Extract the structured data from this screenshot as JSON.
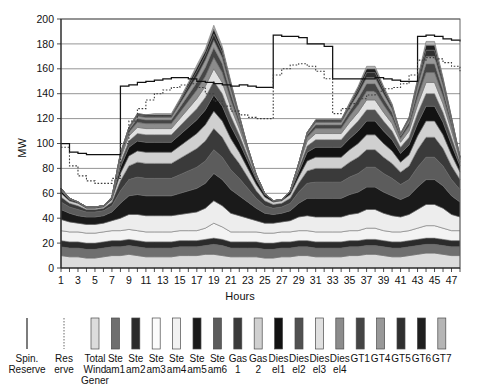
{
  "chart_data": {
    "type": "area",
    "title": "",
    "xlabel": "Hours",
    "ylabel": "MW",
    "ylim": [
      0,
      200
    ],
    "ytick_step": 20,
    "yticks": [
      0,
      20,
      40,
      60,
      80,
      100,
      120,
      140,
      160,
      180,
      200
    ],
    "xlim": [
      1,
      48
    ],
    "xticks": [
      1,
      3,
      5,
      7,
      9,
      11,
      13,
      15,
      17,
      19,
      21,
      23,
      25,
      27,
      29,
      31,
      33,
      35,
      37,
      39,
      41,
      43,
      45,
      47
    ],
    "grid": true,
    "legend_position": "bottom",
    "x": [
      1,
      2,
      3,
      4,
      5,
      6,
      7,
      8,
      9,
      10,
      11,
      12,
      13,
      14,
      15,
      16,
      17,
      18,
      19,
      20,
      21,
      22,
      23,
      24,
      25,
      26,
      27,
      28,
      29,
      30,
      31,
      32,
      33,
      34,
      35,
      36,
      37,
      38,
      39,
      40,
      41,
      42,
      43,
      44,
      45,
      46,
      47,
      48
    ],
    "series": [
      {
        "name": "Total Wind Gener",
        "color": "#dcdcdc",
        "values": [
          10,
          9,
          9,
          8,
          8,
          9,
          10,
          10,
          11,
          10,
          9,
          9,
          9,
          9,
          10,
          10,
          10,
          11,
          11,
          10,
          9,
          9,
          9,
          9,
          8,
          8,
          9,
          9,
          10,
          10,
          9,
          9,
          9,
          9,
          10,
          10,
          11,
          11,
          10,
          9,
          9,
          10,
          11,
          12,
          12,
          11,
          10,
          10
        ]
      },
      {
        "name": "Ste am1",
        "color": "#6f6f6f",
        "values": [
          7,
          7,
          7,
          7,
          7,
          7,
          7,
          7,
          7,
          7,
          7,
          7,
          7,
          7,
          7,
          7,
          7,
          7,
          8,
          8,
          7,
          7,
          7,
          7,
          7,
          7,
          7,
          7,
          7,
          7,
          7,
          7,
          7,
          7,
          7,
          7,
          7,
          7,
          7,
          7,
          7,
          7,
          7,
          7,
          7,
          7,
          7,
          7
        ]
      },
      {
        "name": "Ste am2",
        "color": "#2b2b2b",
        "values": [
          5,
          5,
          5,
          5,
          5,
          5,
          5,
          5,
          5,
          5,
          5,
          5,
          5,
          5,
          5,
          5,
          5,
          5,
          5,
          5,
          5,
          5,
          5,
          5,
          5,
          5,
          5,
          5,
          5,
          5,
          5,
          5,
          5,
          5,
          5,
          5,
          5,
          5,
          5,
          5,
          5,
          5,
          5,
          5,
          5,
          5,
          5,
          5
        ]
      },
      {
        "name": "Ste am3",
        "color": "#f3f3f3",
        "values": [
          8,
          8,
          8,
          8,
          8,
          8,
          8,
          8,
          8,
          8,
          8,
          8,
          8,
          8,
          8,
          8,
          8,
          9,
          12,
          10,
          8,
          8,
          8,
          8,
          8,
          8,
          8,
          8,
          8,
          8,
          8,
          8,
          8,
          8,
          8,
          8,
          9,
          9,
          8,
          8,
          8,
          8,
          9,
          10,
          10,
          9,
          8,
          8
        ]
      },
      {
        "name": "Ste am4",
        "color": "#ededed",
        "values": [
          9,
          8,
          7,
          7,
          7,
          7,
          8,
          10,
          12,
          13,
          13,
          13,
          13,
          13,
          13,
          14,
          15,
          16,
          18,
          17,
          15,
          13,
          11,
          9,
          8,
          8,
          8,
          9,
          11,
          12,
          12,
          12,
          12,
          12,
          13,
          14,
          15,
          15,
          14,
          13,
          12,
          13,
          15,
          17,
          17,
          16,
          13,
          11
        ]
      },
      {
        "name": "Ste am5",
        "color": "#1a1a1a",
        "values": [
          8,
          7,
          6,
          6,
          6,
          6,
          7,
          12,
          15,
          16,
          16,
          16,
          16,
          16,
          17,
          18,
          19,
          20,
          22,
          21,
          19,
          16,
          13,
          10,
          8,
          7,
          7,
          8,
          11,
          14,
          15,
          15,
          15,
          15,
          16,
          17,
          18,
          18,
          17,
          16,
          14,
          15,
          18,
          20,
          20,
          18,
          15,
          12
        ]
      },
      {
        "name": "Ste am6",
        "color": "#5c5c5c",
        "values": [
          6,
          5,
          5,
          4,
          4,
          4,
          5,
          10,
          13,
          14,
          14,
          14,
          14,
          14,
          15,
          16,
          17,
          18,
          19,
          18,
          16,
          14,
          11,
          8,
          6,
          5,
          5,
          6,
          9,
          12,
          13,
          13,
          13,
          13,
          14,
          15,
          16,
          16,
          15,
          14,
          12,
          13,
          16,
          18,
          18,
          16,
          13,
          10
        ]
      },
      {
        "name": "Gas 1",
        "color": "#3a3a3a",
        "values": [
          4,
          3,
          3,
          2,
          2,
          2,
          3,
          8,
          11,
          12,
          12,
          12,
          12,
          12,
          13,
          14,
          15,
          16,
          17,
          16,
          14,
          12,
          9,
          6,
          4,
          3,
          3,
          4,
          7,
          10,
          11,
          11,
          11,
          11,
          12,
          13,
          14,
          14,
          13,
          12,
          10,
          11,
          14,
          16,
          16,
          14,
          11,
          8
        ]
      },
      {
        "name": "Gas 2",
        "color": "#d0d0d0",
        "values": [
          3,
          2,
          2,
          1,
          1,
          1,
          2,
          6,
          8,
          9,
          9,
          9,
          9,
          9,
          10,
          11,
          12,
          13,
          14,
          13,
          11,
          9,
          7,
          5,
          3,
          2,
          2,
          3,
          5,
          8,
          9,
          9,
          9,
          9,
          10,
          11,
          12,
          12,
          11,
          10,
          8,
          9,
          11,
          13,
          13,
          11,
          9,
          6
        ]
      },
      {
        "name": "Dies el1",
        "color": "#121212",
        "values": [
          2,
          1,
          1,
          1,
          1,
          1,
          1,
          5,
          7,
          8,
          8,
          8,
          8,
          8,
          9,
          10,
          11,
          12,
          13,
          12,
          10,
          8,
          6,
          4,
          2,
          1,
          1,
          2,
          4,
          7,
          8,
          8,
          8,
          8,
          9,
          10,
          11,
          11,
          10,
          9,
          7,
          8,
          10,
          12,
          12,
          10,
          8,
          5
        ]
      },
      {
        "name": "Dies el2",
        "color": "#515151",
        "values": [
          1,
          1,
          0,
          0,
          0,
          0,
          1,
          4,
          5,
          6,
          6,
          6,
          6,
          6,
          7,
          8,
          9,
          10,
          11,
          10,
          8,
          6,
          4,
          2,
          1,
          0,
          0,
          1,
          3,
          5,
          6,
          6,
          6,
          6,
          7,
          8,
          9,
          9,
          8,
          7,
          5,
          6,
          8,
          10,
          10,
          8,
          6,
          3
        ]
      },
      {
        "name": "Dies el3",
        "color": "#e0e0e0",
        "values": [
          1,
          0,
          0,
          0,
          0,
          0,
          0,
          3,
          4,
          5,
          5,
          5,
          5,
          5,
          6,
          7,
          8,
          9,
          10,
          9,
          7,
          5,
          3,
          1,
          0,
          0,
          0,
          0,
          2,
          4,
          5,
          5,
          5,
          5,
          6,
          7,
          8,
          8,
          7,
          6,
          4,
          5,
          7,
          9,
          9,
          7,
          5,
          2
        ]
      },
      {
        "name": "Dies el4",
        "color": "#8c8c8c",
        "values": [
          0,
          0,
          0,
          0,
          0,
          0,
          0,
          2,
          3,
          4,
          4,
          4,
          4,
          4,
          5,
          6,
          7,
          8,
          9,
          8,
          6,
          4,
          2,
          1,
          0,
          0,
          0,
          0,
          1,
          3,
          4,
          4,
          4,
          4,
          5,
          6,
          7,
          7,
          6,
          5,
          3,
          4,
          6,
          8,
          8,
          6,
          4,
          1
        ]
      },
      {
        "name": "GT1",
        "color": "#454545",
        "values": [
          0,
          0,
          0,
          0,
          0,
          0,
          0,
          1,
          2,
          3,
          3,
          3,
          3,
          3,
          4,
          5,
          6,
          7,
          8,
          7,
          5,
          3,
          1,
          0,
          0,
          0,
          0,
          0,
          1,
          2,
          3,
          3,
          3,
          3,
          4,
          5,
          6,
          6,
          5,
          4,
          2,
          3,
          5,
          7,
          7,
          5,
          3,
          1
        ]
      },
      {
        "name": "GT4",
        "color": "#989898",
        "values": [
          0,
          0,
          0,
          0,
          0,
          0,
          0,
          1,
          1,
          2,
          2,
          2,
          2,
          2,
          3,
          4,
          5,
          6,
          6,
          5,
          4,
          2,
          1,
          0,
          0,
          0,
          0,
          0,
          0,
          1,
          2,
          2,
          2,
          2,
          3,
          4,
          5,
          5,
          4,
          3,
          1,
          2,
          4,
          6,
          6,
          4,
          2,
          0
        ]
      },
      {
        "name": "GT5",
        "color": "#2f2f2f",
        "values": [
          0,
          0,
          0,
          0,
          0,
          0,
          0,
          0,
          1,
          1,
          1,
          1,
          1,
          1,
          2,
          3,
          4,
          4,
          5,
          4,
          3,
          1,
          0,
          0,
          0,
          0,
          0,
          0,
          0,
          1,
          1,
          1,
          1,
          1,
          2,
          3,
          4,
          4,
          3,
          2,
          1,
          1,
          3,
          5,
          5,
          3,
          1,
          0
        ]
      },
      {
        "name": "GT6",
        "color": "#1f1f1f",
        "values": [
          0,
          0,
          0,
          0,
          0,
          0,
          0,
          0,
          0,
          1,
          1,
          1,
          1,
          1,
          1,
          2,
          3,
          3,
          4,
          3,
          2,
          1,
          0,
          0,
          0,
          0,
          0,
          0,
          0,
          0,
          1,
          1,
          1,
          1,
          1,
          2,
          3,
          3,
          2,
          1,
          0,
          1,
          2,
          4,
          4,
          2,
          1,
          0
        ]
      },
      {
        "name": "GT7",
        "color": "#b5b5b5",
        "values": [
          0,
          0,
          0,
          0,
          0,
          0,
          0,
          0,
          0,
          0,
          0,
          1,
          1,
          1,
          1,
          1,
          2,
          2,
          3,
          2,
          1,
          0,
          0,
          0,
          0,
          0,
          0,
          0,
          0,
          0,
          0,
          0,
          0,
          0,
          1,
          1,
          2,
          2,
          1,
          1,
          0,
          0,
          1,
          3,
          3,
          1,
          0,
          0
        ]
      }
    ],
    "lines": [
      {
        "name": "Spin. Reserve",
        "style": "solid",
        "color": "#111111",
        "values": [
          100,
          93,
          92,
          91,
          91,
          91,
          91,
          146,
          147,
          149,
          150,
          151,
          152,
          153,
          153,
          152,
          150,
          149,
          148,
          147,
          146,
          147,
          146,
          145,
          145,
          187,
          186,
          186,
          185,
          180,
          180,
          178,
          152,
          152,
          152,
          152,
          152,
          153,
          152,
          151,
          150,
          150,
          186,
          187,
          186,
          184,
          183,
          182
        ]
      },
      {
        "name": "Res erve",
        "style": "dotted",
        "color": "#3c3c3c",
        "values": [
          97,
          82,
          74,
          70,
          68,
          68,
          72,
          100,
          118,
          128,
          135,
          140,
          143,
          145,
          147,
          148,
          145,
          140,
          134,
          130,
          126,
          123,
          121,
          120,
          120,
          155,
          160,
          163,
          164,
          162,
          158,
          152,
          124,
          128,
          132,
          136,
          139,
          142,
          144,
          145,
          148,
          155,
          167,
          169,
          168,
          165,
          162,
          158
        ]
      }
    ],
    "legend": [
      {
        "label_lines": [
          "Spin.",
          "Reserve"
        ],
        "type": "line",
        "style": "solid",
        "color": "#111111"
      },
      {
        "label_lines": [
          "Res",
          "erve"
        ],
        "type": "line",
        "style": "dotted",
        "color": "#777777"
      },
      {
        "label_lines": [
          "Total",
          "Wind",
          "Gener"
        ],
        "type": "swatch",
        "color": "#dcdcdc"
      },
      {
        "label_lines": [
          "Ste",
          "am1"
        ],
        "type": "swatch",
        "color": "#6f6f6f"
      },
      {
        "label_lines": [
          "Ste",
          "am2"
        ],
        "type": "swatch",
        "color": "#2b2b2b"
      },
      {
        "label_lines": [
          "Ste",
          "am3"
        ],
        "type": "swatch",
        "color": "#fbfbfb"
      },
      {
        "label_lines": [
          "Ste",
          "am4"
        ],
        "type": "swatch",
        "color": "#f2f2f2"
      },
      {
        "label_lines": [
          "Ste",
          "am5"
        ],
        "type": "swatch",
        "color": "#1a1a1a"
      },
      {
        "label_lines": [
          "Ste",
          "am6"
        ],
        "type": "swatch",
        "color": "#5c5c5c"
      },
      {
        "label_lines": [
          "Gas",
          "1"
        ],
        "type": "swatch",
        "color": "#3a3a3a"
      },
      {
        "label_lines": [
          "Gas",
          "2"
        ],
        "type": "swatch",
        "color": "#d0d0d0"
      },
      {
        "label_lines": [
          "Dies",
          "el1"
        ],
        "type": "swatch",
        "color": "#121212"
      },
      {
        "label_lines": [
          "Dies",
          "el2"
        ],
        "type": "swatch",
        "color": "#515151"
      },
      {
        "label_lines": [
          "Dies",
          "el3"
        ],
        "type": "swatch",
        "color": "#e0e0e0"
      },
      {
        "label_lines": [
          "Dies",
          "el4"
        ],
        "type": "swatch",
        "color": "#8c8c8c"
      },
      {
        "label_lines": [
          "GT1"
        ],
        "type": "swatch",
        "color": "#454545"
      },
      {
        "label_lines": [
          "GT4"
        ],
        "type": "swatch",
        "color": "#989898"
      },
      {
        "label_lines": [
          "GT5"
        ],
        "type": "swatch",
        "color": "#2f2f2f"
      },
      {
        "label_lines": [
          "GT6"
        ],
        "type": "swatch",
        "color": "#1f1f1f"
      },
      {
        "label_lines": [
          "GT7"
        ],
        "type": "swatch",
        "color": "#b5b5b5"
      }
    ]
  }
}
